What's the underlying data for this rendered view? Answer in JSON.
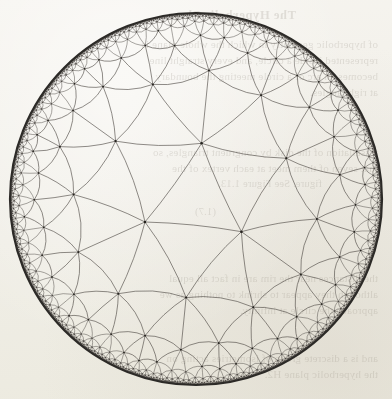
{
  "page": {
    "width": 392,
    "height": 399,
    "background_color": "#f3f1ec",
    "media": "scanned-book-page"
  },
  "figure": {
    "name": "poincare-disk-tessellation",
    "model": "Poincare disk model",
    "geometry": "hyperbolic",
    "schlafli_symbol": "{3,7}",
    "disk": {
      "center_x": 196,
      "center_y": 199,
      "radius": 186,
      "boundary_stroke": "#2c2a27",
      "boundary_stroke_width": 2.2
    },
    "tiling": {
      "polygon_sides": 3,
      "vertex_valence": 7,
      "generations": 7,
      "arc_stroke": "#4a4641",
      "arc_stroke_width": 0.62,
      "vertex_dot_color": "#25231f",
      "vertex_dot_radius": 1.5
    }
  },
  "bleed_through": {
    "note": "Faint mirrored text showing through from the reverse side of the paper.",
    "mirrored": true,
    "opacity": 0.16,
    "ink_color": "#6b6255",
    "lines": [
      {
        "text": "The Hyperbolic Plane",
        "x": 96,
        "y": 8,
        "style": "bleed-head"
      },
      {
        "text": "of hyperbolic geometry in which the whole plane is",
        "x": 14,
        "y": 38,
        "style": "bleed-body"
      },
      {
        "text": "represented inside a circle, and every straight line",
        "x": 14,
        "y": 54,
        "style": "bleed-body"
      },
      {
        "text": "becomes an arc of a circle meeting the boundary",
        "x": 14,
        "y": 70,
        "style": "bleed-body"
      },
      {
        "text": "at right angles.",
        "x": 14,
        "y": 86,
        "style": "bleed-body"
      },
      {
        "text": "tessellation of the disk by congruent triangles, so",
        "x": 14,
        "y": 146,
        "style": "bleed-body"
      },
      {
        "text": "that seven of them meet at each vertex of the",
        "x": 14,
        "y": 162,
        "style": "bleed-body"
      },
      {
        "text": "figure. See Figure 1.13.",
        "x": 70,
        "y": 178,
        "style": "bleed-cap"
      },
      {
        "text": "(1.7)",
        "x": 176,
        "y": 206,
        "style": "bleed-cap"
      },
      {
        "text": "the distances near the rim are in fact all equal",
        "x": 14,
        "y": 272,
        "style": "bleed-body"
      },
      {
        "text": "although they appear to shrink to nothing as we",
        "x": 14,
        "y": 288,
        "style": "bleed-body"
      },
      {
        "text": "approach the circle at infinity.",
        "x": 14,
        "y": 304,
        "style": "bleed-body"
      },
      {
        "text": "and is a discrete group of isometries acting on",
        "x": 14,
        "y": 352,
        "style": "bleed-body"
      },
      {
        "text": "the hyperbolic plane H2.",
        "x": 14,
        "y": 368,
        "style": "bleed-body"
      }
    ]
  }
}
